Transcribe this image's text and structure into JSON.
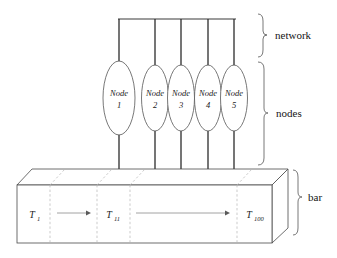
{
  "figure": {
    "background_color": "#ffffff",
    "line_color": "#2b2b2b",
    "accent_color": "#555555"
  },
  "network": {
    "bracket_label": "network",
    "bus_count": 5,
    "bus_line_color": "#3a3a3a"
  },
  "nodes_group": {
    "bracket_label": "nodes",
    "nodes": [
      {
        "label": "Node",
        "number": "1"
      },
      {
        "label": "Node",
        "number": "2"
      },
      {
        "label": "Node",
        "number": "3"
      },
      {
        "label": "Node",
        "number": "4"
      },
      {
        "label": "Node",
        "number": "5"
      }
    ]
  },
  "bar": {
    "bracket_label": "bar",
    "segments": [
      {
        "base": "T",
        "subscript": "1"
      },
      {
        "base": "T",
        "subscript": "11"
      },
      {
        "base": "T",
        "subscript": "100"
      }
    ],
    "arrows": [
      {
        "from": "T1",
        "to": "T11"
      },
      {
        "from": "T11",
        "to": "T100"
      }
    ],
    "fill_color": "#ffffff",
    "edge_color": "#4a4a4a",
    "divider_color": "#b4b4b4"
  }
}
